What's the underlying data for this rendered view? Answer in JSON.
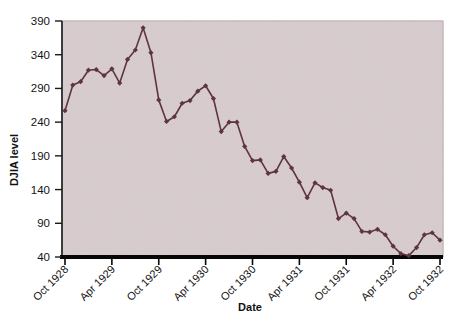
{
  "figure": {
    "background_color": "#ffffff",
    "plot_background_color": "#d8ccce",
    "plot_border_color": "#9c8f91",
    "series_color": "#5e3440",
    "axis_color": "#0a0a0a",
    "text_color": "#141414"
  },
  "chart_data": {
    "type": "line",
    "title": "",
    "xlabel": "Date",
    "ylabel": "DJIA level",
    "xlim": [
      "Oct 1928",
      "Oct 1932"
    ],
    "ylim": [
      40,
      390
    ],
    "yticks": [
      40,
      90,
      140,
      190,
      240,
      290,
      340,
      390
    ],
    "ytick_labels": [
      "40",
      "90",
      "140",
      "190",
      "240",
      "290",
      "340",
      "390"
    ],
    "xticks": [
      "Oct 1928",
      "Apr 1929",
      "Oct 1929",
      "Apr 1930",
      "Oct 1930",
      "Apr 1931",
      "Oct 1931",
      "Apr 1932",
      "Oct 1932"
    ],
    "xtick_label_rotation": -45,
    "grid": false,
    "legend": false,
    "marker": "diamond",
    "series": [
      {
        "name": "DJIA level",
        "x": [
          "Oct 1928",
          "Nov 1928",
          "Dec 1928",
          "Jan 1929",
          "Feb 1929",
          "Mar 1929",
          "Apr 1929",
          "May 1929",
          "Jun 1929",
          "Jul 1929",
          "Aug 1929",
          "Sep 1929",
          "Oct 1929",
          "Nov 1929",
          "Dec 1929",
          "Jan 1930",
          "Feb 1930",
          "Mar 1930",
          "Apr 1930",
          "May 1930",
          "Jun 1930",
          "Jul 1930",
          "Aug 1930",
          "Sep 1930",
          "Oct 1930",
          "Nov 1930",
          "Dec 1930",
          "Jan 1931",
          "Feb 1931",
          "Mar 1931",
          "Apr 1931",
          "May 1931",
          "Jun 1931",
          "Jul 1931",
          "Aug 1931",
          "Sep 1931",
          "Oct 1931",
          "Nov 1931",
          "Dec 1931",
          "Jan 1932",
          "Feb 1932",
          "Mar 1932",
          "Apr 1932",
          "May 1932",
          "Jun 1932",
          "Jul 1932",
          "Aug 1932",
          "Sep 1932",
          "Oct 1932"
        ],
        "values": [
          257,
          295,
          300,
          317,
          318,
          309,
          319,
          298,
          333,
          347,
          380,
          343,
          273,
          241,
          248,
          268,
          272,
          286,
          294,
          275,
          226,
          240,
          240,
          204,
          183,
          184,
          164,
          167,
          189,
          172,
          151,
          128,
          150,
          143,
          139,
          97,
          105,
          97,
          78,
          77,
          81,
          73,
          56,
          45,
          42,
          54,
          73,
          76,
          65
        ]
      }
    ]
  }
}
